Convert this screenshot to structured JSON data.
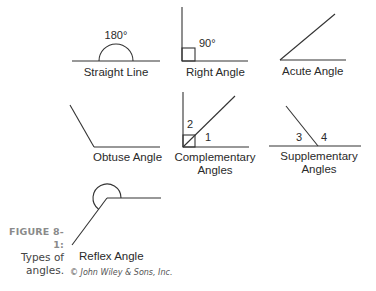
{
  "figure": {
    "label": "FIGURE 8-1:",
    "caption_line1": "Types of",
    "caption_line2": "angles.",
    "credit": "© John Wiley & Sons, Inc."
  },
  "angles": {
    "straight": {
      "name": "Straight Line",
      "measure": "180°"
    },
    "right": {
      "name": "Right Angle",
      "measure": "90°"
    },
    "acute": {
      "name": "Acute Angle"
    },
    "obtuse": {
      "name": "Obtuse Angle"
    },
    "complementary": {
      "name_line1": "Complementary",
      "name_line2": "Angles",
      "angle_a": "1",
      "angle_b": "2"
    },
    "supplementary": {
      "name_line1": "Supplementary",
      "name_line2": "Angles",
      "angle_a": "3",
      "angle_b": "4"
    },
    "reflex": {
      "name": "Reflex Angle"
    }
  },
  "colors": {
    "stroke": "#333333",
    "figure_label": "#8a8a8a"
  }
}
